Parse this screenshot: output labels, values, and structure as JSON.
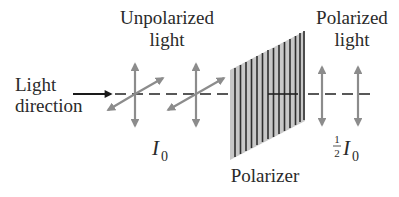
{
  "diagram": {
    "labels": {
      "unpolarized_line1": "Unpolarized",
      "unpolarized_line2": "light",
      "polarized_line1": "Polarized",
      "polarized_line2": "light",
      "direction_line1": "Light",
      "direction_line2": "direction",
      "polarizer": "Polarizer",
      "intensity_in_symbol": "I",
      "intensity_in_sub": "0",
      "intensity_out_frac_num": "1",
      "intensity_out_frac_den": "2",
      "intensity_out_symbol": "I",
      "intensity_out_sub": "0"
    },
    "colors": {
      "text": "#2a2a2a",
      "axis_line": "#222222",
      "polarization_arrows": "#8c8c8c",
      "polarizer_fill": "#c8c8c8",
      "polarizer_lines": "#2e2e2e"
    },
    "elements": {
      "unpolarized_vectors": [
        "vertical",
        "diagonal"
      ],
      "polarized_vectors": [
        "vertical"
      ],
      "polarizer_line_count": 14
    }
  }
}
